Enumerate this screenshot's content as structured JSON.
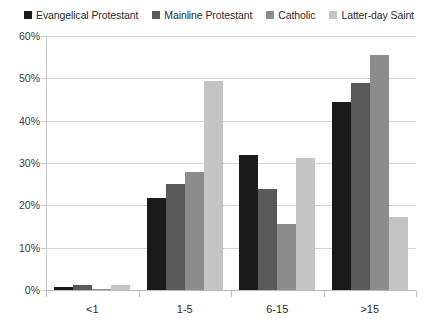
{
  "chart_data": {
    "type": "bar",
    "title": "",
    "subtitle": "",
    "xlabel": "",
    "ylabel": "",
    "categories": [
      "<1",
      "1-5",
      "6-15",
      ">15"
    ],
    "ylim": [
      0,
      60
    ],
    "y_ticks": [
      0,
      10,
      20,
      30,
      40,
      50,
      60
    ],
    "y_tick_labels": [
      "0%",
      "10%",
      "20%",
      "30%",
      "40%",
      "50%",
      "60%"
    ],
    "grid": true,
    "legend_position": "top",
    "series": [
      {
        "name": "Evangelical Protestant",
        "color": "#1a1a1a",
        "values": [
          0.8,
          21.8,
          32.0,
          44.3
        ]
      },
      {
        "name": "Mainline Protestant",
        "color": "#595959",
        "values": [
          1.2,
          25.0,
          23.8,
          49.0
        ]
      },
      {
        "name": "Catholic",
        "color": "#8c8c8c",
        "values": [
          0.3,
          27.8,
          15.6,
          55.5
        ]
      },
      {
        "name": "Latter-day Saint",
        "color": "#c4c4c4",
        "values": [
          1.3,
          49.3,
          31.1,
          17.3
        ]
      }
    ]
  },
  "legend": {
    "items": [
      {
        "label": "Evangelical Protestant",
        "color": "#1a1a1a"
      },
      {
        "label": "Mainline Protestant",
        "color": "#595959"
      },
      {
        "label": "Catholic",
        "color": "#8c8c8c"
      },
      {
        "label": "Latter-day Saint",
        "color": "#c4c4c4"
      }
    ]
  },
  "axes": {
    "y_tick_labels": [
      "60%",
      "50%",
      "40%",
      "30%",
      "20%",
      "10%",
      "0%"
    ],
    "x_tick_labels": [
      "<1",
      "1-5",
      "6-15",
      ">15"
    ]
  }
}
